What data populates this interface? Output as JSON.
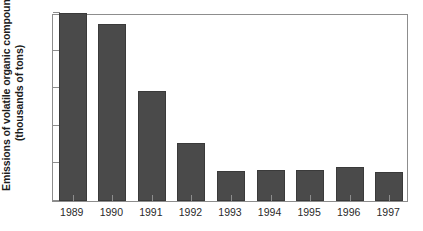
{
  "chart_data": {
    "type": "bar",
    "title": "",
    "xlabel": "",
    "ylabel": "Emissions of volatile organic compounds (thousands of tons)",
    "ylabel_lines": [
      "Emissions of volatile organic compounds",
      "(thousands of tons)"
    ],
    "categories": [
      "1989",
      "1990",
      "1991",
      "1992",
      "1993",
      "1994",
      "1995",
      "1996",
      "1997"
    ],
    "values": [
      15.0,
      14.1,
      8.8,
      4.6,
      2.4,
      2.5,
      2.5,
      2.7,
      2.3
    ],
    "ylim": [
      0,
      15
    ],
    "yticks": [
      0,
      3,
      6,
      9,
      12,
      15
    ],
    "ytick_labels": [
      "0",
      "3",
      "6",
      "9",
      "12",
      "15"
    ],
    "grid": false,
    "legend": false,
    "bar_color": "#4a4a4a",
    "frame_color": "#8d8d8d",
    "background": "#ffffff"
  }
}
